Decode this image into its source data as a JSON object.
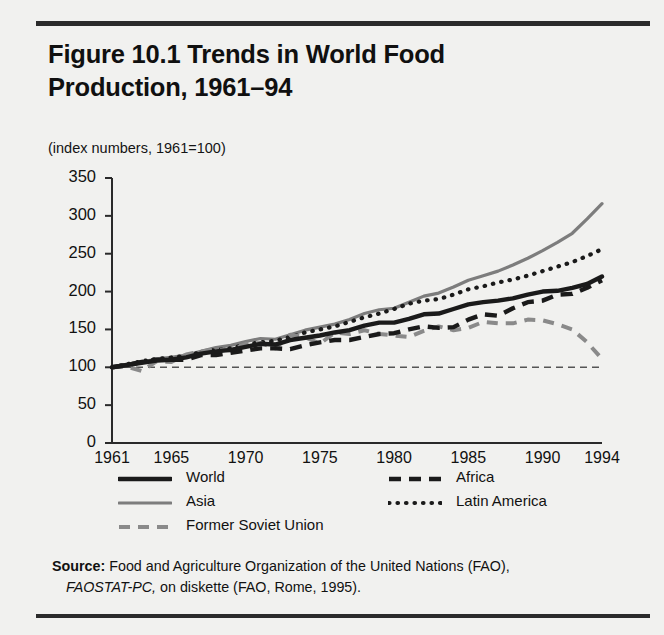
{
  "figure": {
    "title": "Figure 10.1  Trends in World Food Production, 1961–94",
    "subtitle": "(index numbers, 1961=100)"
  },
  "source": {
    "label": "Source:",
    "line1": " Food and Agriculture Organization of the United Nations (FAO),",
    "line2_italic": "FAOSTAT-PC,",
    "line2_rest": " on diskette (FAO, Rome, 1995)."
  },
  "legend": {
    "items": [
      {
        "label": "World",
        "style": "solid-thick-black",
        "color": "#1a1a1a"
      },
      {
        "label": "Asia",
        "style": "solid-gray",
        "color": "#7d7d7d"
      },
      {
        "label": "Former Soviet Union",
        "style": "dashed-gray",
        "color": "#8a8a8a"
      },
      {
        "label": "Africa",
        "style": "dashed-black",
        "color": "#1a1a1a"
      },
      {
        "label": "Latin America",
        "style": "dotted-black",
        "color": "#1a1a1a"
      }
    ]
  },
  "chart_data": {
    "type": "line",
    "title": "Figure 10.1  Trends in World Food Production, 1961–94",
    "subtitle": "(index numbers, 1961=100)",
    "xlabel": "",
    "ylabel": "",
    "ylim": [
      0,
      350
    ],
    "yticks": [
      0,
      50,
      100,
      150,
      200,
      250,
      300,
      350
    ],
    "xlim": [
      1961,
      1994
    ],
    "xticks": [
      1961,
      1965,
      1970,
      1975,
      1980,
      1985,
      1990,
      1994
    ],
    "xtick_labels": [
      "1961",
      "1965",
      "1970",
      "1975",
      "1980",
      "1985",
      "1990",
      "1994"
    ],
    "grid": false,
    "legend_position": "below-axes",
    "reference_line": {
      "value": 100,
      "style": "dashed",
      "color": "#555555"
    },
    "x": [
      1961,
      1962,
      1963,
      1964,
      1965,
      1966,
      1967,
      1968,
      1969,
      1970,
      1971,
      1972,
      1973,
      1974,
      1975,
      1976,
      1977,
      1978,
      1979,
      1980,
      1981,
      1982,
      1983,
      1984,
      1985,
      1986,
      1987,
      1988,
      1989,
      1990,
      1991,
      1992,
      1993,
      1994
    ],
    "series": [
      {
        "name": "World",
        "color": "#1a1a1a",
        "style": "solid-thick-black",
        "values": [
          100,
          103,
          106,
          109,
          110,
          113,
          118,
          121,
          123,
          127,
          131,
          130,
          136,
          139,
          142,
          146,
          149,
          155,
          159,
          159,
          164,
          170,
          171,
          177,
          183,
          186,
          188,
          191,
          196,
          200,
          201,
          205,
          210,
          220
        ]
      },
      {
        "name": "Asia",
        "color": "#7d7d7d",
        "style": "solid-gray",
        "values": [
          100,
          104,
          107,
          111,
          113,
          116,
          121,
          126,
          129,
          134,
          138,
          137,
          143,
          149,
          153,
          157,
          163,
          171,
          176,
          178,
          186,
          194,
          198,
          206,
          215,
          221,
          227,
          235,
          244,
          254,
          265,
          277,
          296,
          316
        ]
      },
      {
        "name": "Former Soviet Union",
        "color": "#8a8a8a",
        "style": "dashed-gray",
        "values": [
          100,
          101,
          95,
          108,
          107,
          117,
          121,
          124,
          122,
          131,
          132,
          125,
          143,
          140,
          131,
          146,
          144,
          149,
          144,
          142,
          140,
          148,
          154,
          149,
          152,
          160,
          158,
          158,
          163,
          162,
          157,
          150,
          133,
          111
        ]
      },
      {
        "name": "Africa",
        "color": "#1a1a1a",
        "style": "dashed-black",
        "values": [
          100,
          103,
          107,
          110,
          110,
          110,
          116,
          116,
          119,
          122,
          125,
          125,
          124,
          129,
          133,
          136,
          136,
          140,
          144,
          145,
          150,
          154,
          152,
          153,
          163,
          170,
          168,
          178,
          186,
          188,
          196,
          197,
          205,
          215
        ]
      },
      {
        "name": "Latin America",
        "color": "#1a1a1a",
        "style": "dotted-black",
        "values": [
          100,
          104,
          108,
          111,
          113,
          115,
          120,
          123,
          125,
          130,
          133,
          135,
          140,
          146,
          150,
          154,
          160,
          166,
          171,
          177,
          184,
          188,
          190,
          196,
          203,
          207,
          212,
          216,
          221,
          227,
          233,
          239,
          247,
          256
        ]
      }
    ]
  }
}
